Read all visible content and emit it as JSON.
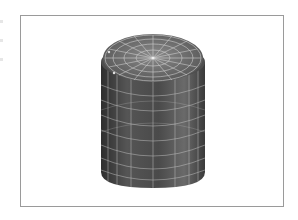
{
  "figure": {
    "view": "isometric",
    "colors": {
      "frame_border": "#9a9a9a",
      "background": "#ffffff",
      "surface_dark": "#3a3a3a",
      "surface_mid": "#5a5a5a",
      "surface_light": "#7a7a7a",
      "wireframe": "#d8d8d8"
    },
    "mesh": {
      "radial_segments": 16,
      "top_rings": 4,
      "body_bands": 7
    }
  }
}
